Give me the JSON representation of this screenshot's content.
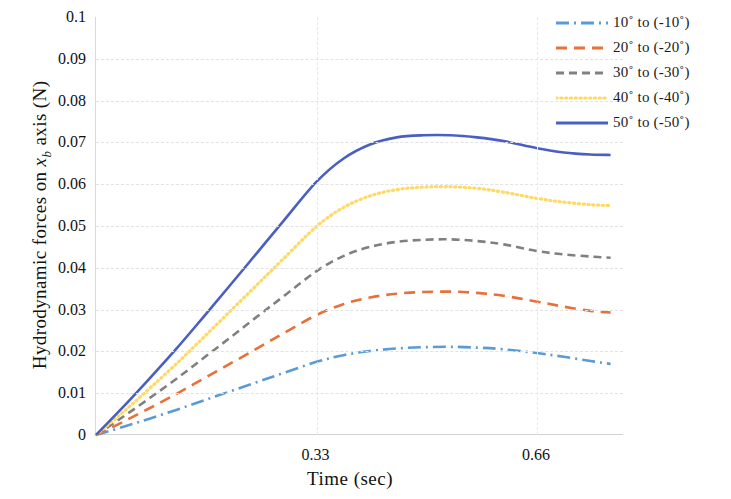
{
  "chart_data": {
    "type": "line",
    "title": "",
    "xlabel": "Time  (sec)",
    "ylabel": "Hydrodynamic  forces  on  xᵇ axis  (N)",
    "ylabel_parts": {
      "prefix": "Hydrodynamic  forces  on ",
      "var": "x",
      "sub": "b",
      "suffix": " axis  (N)"
    },
    "xlim": [
      0,
      0.79
    ],
    "ylim": [
      0,
      0.1
    ],
    "grid": true,
    "legend_position": "top-right",
    "x_tick_labels": [
      "0.33",
      "0.66"
    ],
    "x_tick_values": [
      0.33,
      0.66
    ],
    "y_tick_labels": [
      "0.1",
      "0.09",
      "0.08",
      "0.07",
      "0.06",
      "0.05",
      "0.04",
      "0.03",
      "0.02",
      "0.01",
      "0"
    ],
    "y_tick_values": [
      0.1,
      0.09,
      0.08,
      0.07,
      0.06,
      0.05,
      0.04,
      0.03,
      0.02,
      0.01,
      0
    ],
    "x": [
      0.0,
      0.04,
      0.08,
      0.12,
      0.16,
      0.2,
      0.24,
      0.28,
      0.33,
      0.37,
      0.41,
      0.45,
      0.49,
      0.53,
      0.57,
      0.61,
      0.66,
      0.7,
      0.74,
      0.77
    ],
    "series": [
      {
        "name": "10° to (-10°)",
        "label": "10˚ to (-10˚)",
        "color": "#5b9bd5",
        "dash": "dash-dot",
        "values": [
          0.0,
          0.0019,
          0.0039,
          0.006,
          0.0082,
          0.0104,
          0.0126,
          0.0148,
          0.0175,
          0.0191,
          0.0201,
          0.0207,
          0.021,
          0.0211,
          0.0209,
          0.0205,
          0.0196,
          0.0187,
          0.0177,
          0.017
        ]
      },
      {
        "name": "20° to (-20°)",
        "label": "20˚ to (-20˚)",
        "color": "#e8703a",
        "dash": "dash",
        "values": [
          0.0,
          0.0031,
          0.0064,
          0.0098,
          0.0134,
          0.017,
          0.0206,
          0.0243,
          0.0287,
          0.0313,
          0.0329,
          0.0338,
          0.0342,
          0.0343,
          0.034,
          0.0333,
          0.0319,
          0.0307,
          0.0297,
          0.0293
        ]
      },
      {
        "name": "30° to (-30°)",
        "label": "30˚ to (-30˚)",
        "color": "#808080",
        "dash": "dash-med",
        "values": [
          0.0,
          0.0043,
          0.0088,
          0.0134,
          0.0183,
          0.0232,
          0.0282,
          0.0331,
          0.0392,
          0.0428,
          0.045,
          0.0462,
          0.0467,
          0.0468,
          0.0464,
          0.0456,
          0.044,
          0.0432,
          0.0427,
          0.0424
        ]
      },
      {
        "name": "40° to (-40°)",
        "label": "40˚ to (-40˚)",
        "color": "#ffd966",
        "dash": "dot",
        "values": [
          0.0,
          0.0054,
          0.0111,
          0.017,
          0.0232,
          0.0295,
          0.0358,
          0.0421,
          0.0499,
          0.0544,
          0.0572,
          0.0587,
          0.0593,
          0.0594,
          0.059,
          0.0581,
          0.0566,
          0.0557,
          0.0551,
          0.0549
        ]
      },
      {
        "name": "50° to (-50°)",
        "label": "50˚ to (-50˚)",
        "color": "#4a5fc1",
        "dash": "solid",
        "values": [
          0.0,
          0.0066,
          0.0135,
          0.0206,
          0.0281,
          0.0357,
          0.0434,
          0.0511,
          0.0606,
          0.0661,
          0.0695,
          0.0712,
          0.0717,
          0.0717,
          0.0712,
          0.0703,
          0.0686,
          0.0676,
          0.0671,
          0.067
        ]
      }
    ]
  },
  "axis": {
    "y_title_prefix": "Hydrodynamic  forces  on ",
    "y_title_var": "x",
    "y_title_sub": "b",
    "y_title_suffix": " axis  (N)",
    "x_title": "Time  (sec)"
  }
}
